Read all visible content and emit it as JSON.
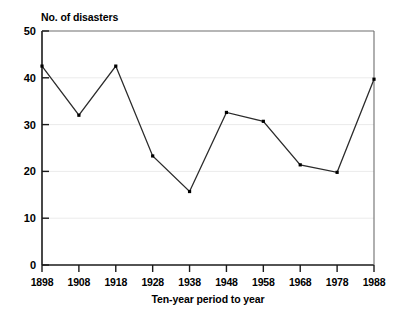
{
  "chart_data": {
    "type": "line",
    "title": "",
    "ylabel": "No. of disasters",
    "xlabel": "Ten-year period to year",
    "categories": [
      "1898",
      "1908",
      "1918",
      "1928",
      "1938",
      "1948",
      "1958",
      "1968",
      "1978",
      "1988"
    ],
    "x": [
      1898,
      1908,
      1918,
      1928,
      1938,
      1948,
      1958,
      1968,
      1978,
      1988
    ],
    "values": [
      42.5,
      32.0,
      42.5,
      23.3,
      15.7,
      32.6,
      30.7,
      21.4,
      19.8,
      39.7
    ],
    "ylim": [
      0,
      50
    ],
    "yticks": [
      0,
      10,
      20,
      30,
      40,
      50
    ],
    "ytick_labels": [
      "0",
      "10",
      "20",
      "30",
      "40",
      "50"
    ],
    "xtick_labels": [
      "1898",
      "1908",
      "1918",
      "1928",
      "1938",
      "1948",
      "1958",
      "1968",
      "1978",
      "1988"
    ],
    "grid": true,
    "grid_axis": "y",
    "legend": "none",
    "series": [
      {
        "name": "No. of disasters",
        "values": [
          42.5,
          32.0,
          42.5,
          23.3,
          15.7,
          32.6,
          30.7,
          21.4,
          19.8,
          39.7
        ],
        "marker": "square",
        "color": "#1a1a1a"
      }
    ]
  },
  "colors": {
    "line": "#2b2b2b",
    "marker": "#000000",
    "axis": "#1a1a1a",
    "grid": "#ebebeb",
    "background": "#ffffff",
    "text": "#000000"
  }
}
